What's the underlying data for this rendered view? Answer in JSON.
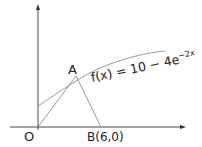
{
  "diagram": {
    "function_label": "f(x) = 10 − 4e",
    "exponent": "−2x",
    "point_a": "A",
    "origin": "O",
    "point_b": "B(6,0)",
    "colors": {
      "axis": "#333333",
      "curve": "#9a9a9a",
      "lines": "#8a8a8a",
      "text": "#222222"
    }
  }
}
